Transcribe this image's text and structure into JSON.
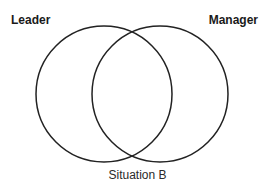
{
  "diagram": {
    "type": "venn",
    "sets": [
      {
        "name": "Leader",
        "position": "left"
      },
      {
        "name": "Manager",
        "position": "right"
      }
    ],
    "caption": "Situation B",
    "colors": {
      "stroke": "#222222",
      "fill": "none",
      "text": "#1a1a1a"
    }
  }
}
